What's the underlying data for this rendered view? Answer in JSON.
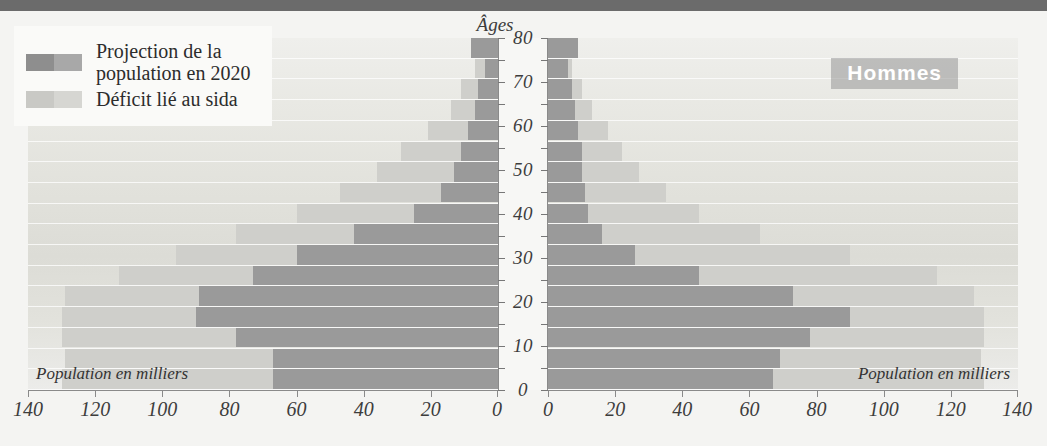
{
  "legend": {
    "items": [
      {
        "label": "Projection de la\npopulation en 2020",
        "line1": "Projection de la",
        "line2": "population en 2020",
        "color_a": "#8e8e8e",
        "color_b": "#a8a8a8"
      },
      {
        "label": "Déficit lié au sida",
        "line1": "Déficit lié au sida",
        "line2": "",
        "color_a": "#c9c9c5",
        "color_b": "#d6d6d2"
      }
    ]
  },
  "labels": {
    "age_axis_title": "Âges",
    "men": "Hommes",
    "women": "Femmes",
    "pop_note_left": "Population en milliers",
    "pop_note_right": "Population en milliers"
  },
  "colors": {
    "projection": "#9a9a9a",
    "deficit": "#cfcfcb",
    "axis": "#8a8a8a",
    "topbar": "#6b6b6b",
    "plot_bg": "#e6e6e0",
    "center_strip": "#f7f7f5"
  },
  "chart_data": {
    "type": "bar",
    "subtype": "population-pyramid",
    "title": "",
    "xlabel": "Population en milliers",
    "ylabel": "Âges",
    "xlim": [
      0,
      140
    ],
    "ylim": [
      0,
      80
    ],
    "x_ticks": [
      0,
      20,
      40,
      60,
      80,
      100,
      120,
      140
    ],
    "y_ticks": [
      0,
      10,
      20,
      30,
      40,
      50,
      60,
      70,
      80
    ],
    "y_minor_ticks": [
      5,
      15,
      25,
      35,
      45,
      55,
      65,
      75
    ],
    "grid": true,
    "legend_position": "top-left",
    "age_groups": [
      "0-4",
      "5-9",
      "10-14",
      "15-19",
      "20-24",
      "25-29",
      "30-34",
      "35-39",
      "40-44",
      "45-49",
      "50-54",
      "55-59",
      "60-64",
      "65-69",
      "70-74",
      "75-79",
      "80+"
    ],
    "series": [
      {
        "name": "Projection de la population en 2020",
        "side": "Hommes",
        "values": [
          67,
          67,
          78,
          90,
          89,
          73,
          60,
          43,
          25,
          17,
          13,
          11,
          9,
          7,
          6,
          4,
          8
        ]
      },
      {
        "name": "Déficit lié au sida",
        "side": "Hommes",
        "values": [
          63,
          62,
          52,
          40,
          40,
          40,
          36,
          35,
          35,
          30,
          23,
          18,
          12,
          7,
          5,
          3,
          0
        ]
      },
      {
        "name": "Projection de la population en 2020",
        "side": "Femmes",
        "values": [
          67,
          69,
          78,
          90,
          73,
          45,
          26,
          16,
          12,
          11,
          10,
          10,
          9,
          8,
          7,
          6,
          9
        ]
      },
      {
        "name": "Déficit lié au sida",
        "side": "Femmes",
        "values": [
          63,
          60,
          52,
          40,
          54,
          71,
          64,
          47,
          33,
          24,
          17,
          12,
          9,
          5,
          3,
          1,
          0
        ]
      }
    ]
  }
}
